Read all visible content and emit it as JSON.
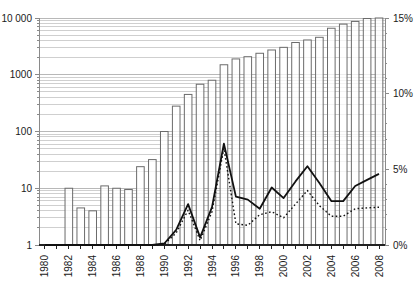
{
  "chart_data": {
    "type": "bar",
    "subtype": "log-bar with two percentage line series (combo chart)",
    "title": "",
    "xlabel": "",
    "ylabel_left": "",
    "ylabel_right": "",
    "categories": [
      1980,
      1981,
      1982,
      1983,
      1984,
      1985,
      1986,
      1987,
      1988,
      1989,
      1990,
      1991,
      1992,
      1993,
      1994,
      1995,
      1996,
      1997,
      1998,
      1999,
      2000,
      2001,
      2002,
      2003,
      2004,
      2005,
      2006,
      2007,
      2008
    ],
    "x_tick_labels": [
      "1980",
      "1982",
      "1984",
      "1986",
      "1988",
      "1990",
      "1992",
      "1994",
      "1996",
      "1998",
      "2000",
      "2002",
      "2004",
      "2006",
      "2008"
    ],
    "left_axis": {
      "scale": "log",
      "range": [
        1,
        10000
      ],
      "tick_labels": [
        "1",
        "10",
        "100",
        "1000",
        "10 000"
      ],
      "tick_values": [
        1,
        10,
        100,
        1000,
        10000
      ]
    },
    "right_axis": {
      "scale": "linear",
      "range": [
        0,
        15
      ],
      "unit": "%",
      "tick_labels": [
        "0%",
        "5%",
        "10%",
        "15%"
      ],
      "tick_values": [
        0,
        5,
        10,
        15
      ]
    },
    "bars": {
      "name": "count-bars-left-log-axis",
      "values": [
        null,
        null,
        10,
        4.5,
        4,
        11,
        10,
        9.5,
        24,
        32,
        100,
        280,
        450,
        680,
        800,
        1500,
        1900,
        2080,
        2390,
        2730,
        3040,
        3700,
        4100,
        4570,
        6600,
        7800,
        8700,
        9800,
        10000
      ]
    },
    "series": [
      {
        "name": "solid-line-percent-right-axis",
        "style": "solid",
        "values": [
          0,
          0,
          0,
          0,
          0,
          0,
          0,
          0,
          0,
          0,
          0.1,
          1.0,
          2.7,
          0.5,
          2.5,
          6.7,
          3.2,
          3.0,
          2.4,
          3.8,
          3.1,
          4.2,
          5.2,
          4.1,
          2.9,
          2.9,
          3.9,
          4.3,
          4.7
        ]
      },
      {
        "name": "dotted-line-percent-right-axis",
        "style": "dotted",
        "values": [
          0,
          0,
          0,
          0,
          0,
          0,
          0,
          0,
          0,
          0,
          0.05,
          0.8,
          2.3,
          0.3,
          2.2,
          6.4,
          1.4,
          1.3,
          2.0,
          2.2,
          1.8,
          2.7,
          3.6,
          2.6,
          1.9,
          1.9,
          2.4,
          2.45,
          2.5
        ]
      }
    ],
    "grid": {
      "horizontal_minor_log": true,
      "vertical": false,
      "legend": "none"
    },
    "colors": {
      "background": "#ffffff",
      "bar_fill": "#ffffff",
      "bar_outline": "#6b6b6b",
      "grid_minor": "#cfcfcf",
      "grid_major": "#b8b8b8",
      "axis_side": "#8a8a8a",
      "axis_bottom": "#222222",
      "line": "#111111",
      "text": "#1a1a1a"
    }
  }
}
